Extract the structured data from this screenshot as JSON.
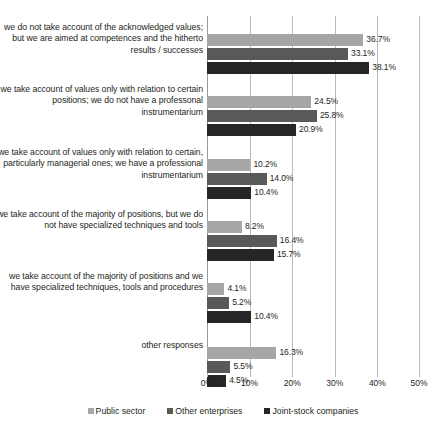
{
  "chart_data": {
    "type": "bar",
    "orientation": "horizontal",
    "title": "",
    "xlabel": "",
    "ylabel": "",
    "xlim": [
      0,
      50
    ],
    "xticks": [
      "0%",
      "10%",
      "20%",
      "30%",
      "40%",
      "50%"
    ],
    "xtick_values": [
      0,
      10,
      20,
      30,
      40,
      50
    ],
    "grid": true,
    "legend_position": "bottom",
    "categories": [
      "we do not take account of the acknowledged values; but we are aimed at competences and the hitherto results / successes",
      "we take account of values only with relation to certain positions; we do not have a professonal instrumentarium",
      "we take account of values only with relation to certain, particularly managerial ones; we have a professional instrumentarium",
      "we take account of the majority of positions, but we do not have specialized techniques and tools",
      "we take account of the majority of positions and we have specialized techniques, tools and procedures",
      "other responses"
    ],
    "series": [
      {
        "name": "Public sector",
        "color": "#a6a6a6",
        "values": [
          36.7,
          24.5,
          10.2,
          8.2,
          4.1,
          16.3
        ],
        "labels": [
          "36.7%",
          "24.5%",
          "10.2%",
          "8.2%",
          "4.1%",
          "16.3%"
        ]
      },
      {
        "name": "Other enterprises",
        "color": "#595959",
        "values": [
          33.1,
          25.8,
          14.0,
          16.4,
          5.2,
          5.5
        ],
        "labels": [
          "33.1%",
          "25.8%",
          "14.0%",
          "16.4%",
          "5.2%",
          "5.5%"
        ]
      },
      {
        "name": "Joint-stock companies",
        "color": "#262626",
        "values": [
          38.1,
          20.9,
          10.4,
          15.7,
          10.4,
          4.5
        ],
        "labels": [
          "38.1%",
          "20.9%",
          "10.4%",
          "15.7%",
          "10.4%",
          "4.5%"
        ]
      }
    ]
  },
  "legend": {
    "items": [
      {
        "label": "Public sector"
      },
      {
        "label": "Other enterprises"
      },
      {
        "label": "Joint-stock companies"
      }
    ]
  },
  "categories_display": [
    {
      "label": "we do not take account of the acknowledged values; but we are aimed at competences and the hitherto results / successes"
    },
    {
      "label": "we take account of values only with relation to certain positions; we do not have a professonal instrumentarium"
    },
    {
      "label": "we take account of values only with relation to certain, particularly managerial ones; we have a professional instrumentarium"
    },
    {
      "label": "we take account of the majority of positions, but we do not have specialized techniques and tools"
    },
    {
      "label": "we take account of the majority of positions and we have specialized techniques, tools and procedures"
    },
    {
      "label": "other responses"
    }
  ]
}
